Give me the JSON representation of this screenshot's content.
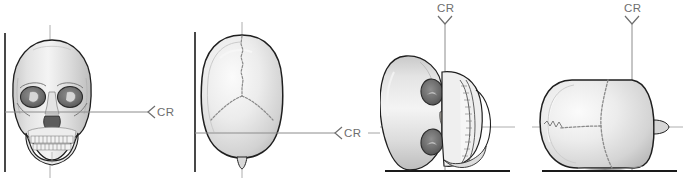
{
  "figure": {
    "type": "radiographic-positioning-illustration",
    "background_color": "#ffffff",
    "width": 683,
    "height": 182,
    "line_color_reference": "#8c8c8c",
    "line_color_receptor": "#1a1a1a",
    "bone_outline_color": "#1f1f1f",
    "bone_fill_color": "#e9e9e9",
    "suture_color": "#8a8a8a"
  },
  "panels": [
    {
      "id": "panel-1",
      "name": "ap-skull-frontal",
      "view_label": "frontal skull with horizontal central ray",
      "cr": {
        "label": "CR",
        "arrow": "left-arrowhead",
        "orientation": "horizontal",
        "direction": "right-to-left"
      },
      "has_vertical_receptor_line": true,
      "has_baseline": false
    },
    {
      "id": "panel-2",
      "name": "vertex-skull-superior",
      "view_label": "superior skull showing sagittal and lambdoid sutures",
      "cr": {
        "label": "CR",
        "arrow": "left-arrowhead",
        "orientation": "horizontal",
        "direction": "right-to-left"
      },
      "has_vertical_receptor_line": true,
      "has_baseline": false
    },
    {
      "id": "panel-3",
      "name": "frontal-skull-rotated-lateral-recumbent",
      "view_label": "frontal skull rotated 90 degrees, recumbent on table",
      "cr": {
        "label": "CR",
        "arrow": "down-arrowhead",
        "orientation": "vertical",
        "direction": "top-to-bottom"
      },
      "has_vertical_receptor_line": false,
      "has_baseline": true
    },
    {
      "id": "panel-4",
      "name": "vertex-skull-rotated-lateral-recumbent",
      "view_label": "superior skull rotated 90 degrees, recumbent on table",
      "cr": {
        "label": "CR",
        "arrow": "down-arrowhead",
        "orientation": "vertical",
        "direction": "top-to-bottom"
      },
      "has_vertical_receptor_line": false,
      "has_baseline": true
    }
  ]
}
